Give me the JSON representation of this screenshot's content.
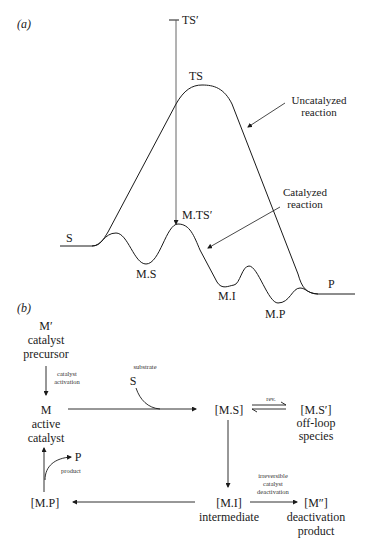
{
  "panel_a": {
    "label": "(a)",
    "states": {
      "ts_prime": "TS′",
      "ts": "TS",
      "m_ts_prime": "M.TS′",
      "s": "S",
      "m_s": "M.S",
      "m_i": "M.I",
      "m_p": "M.P",
      "p": "P"
    },
    "annotations": {
      "uncatalyzed_line1": "Uncatalyzed",
      "uncatalyzed_line2": "reaction",
      "catalyzed_line1": "Catalyzed",
      "catalyzed_line2": "reaction"
    }
  },
  "panel_b": {
    "label": "(b)",
    "m_prime": {
      "symbol": "M′",
      "line1": "catalyst",
      "line2": "precursor"
    },
    "activation": {
      "line1": "catalyst",
      "line2": "activation"
    },
    "substrate": {
      "caption": "substrate",
      "symbol": "S"
    },
    "m": {
      "symbol": "M",
      "line1": "active",
      "line2": "catalyst"
    },
    "ms": {
      "symbol": "[M.S]"
    },
    "rev": "rev.",
    "ms_prime": {
      "symbol": "[M.S′]",
      "line1": "off-loop",
      "line2": "species"
    },
    "mi": {
      "symbol": "[M.I]",
      "line1": "intermediate"
    },
    "deactivation": {
      "line1": "irreversible",
      "line2": "catalyst",
      "line3": "deactivation"
    },
    "m_double_prime": {
      "symbol": "[M″]",
      "line1": "deactivation",
      "line2": "product"
    },
    "mp": {
      "symbol": "[M.P]"
    },
    "product": {
      "symbol": "P",
      "caption": "product"
    }
  }
}
